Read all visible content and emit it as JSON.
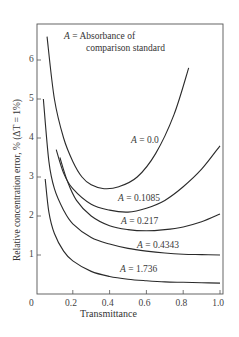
{
  "chart_data": {
    "type": "line",
    "title": "",
    "xlabel": "Transmittance",
    "ylabel": "Relative concentration error, % (ΔT = 1%)",
    "xlim": [
      0,
      1.0
    ],
    "ylim": [
      0,
      6.9
    ],
    "xticks": [
      "0",
      "0.2",
      "0.4",
      "0.6",
      "0.8",
      "1.0"
    ],
    "yticks": [
      "1",
      "2",
      "3",
      "4",
      "5",
      "6"
    ],
    "grid": false,
    "legend": {
      "line1_var": "A",
      "line1_text": " = Absorbance of",
      "line2_text": "comparison standard"
    },
    "series": [
      {
        "name": "A = 0.0",
        "label_var": "A",
        "label_text": " = 0.0",
        "x": [
          0.06,
          0.1,
          0.15,
          0.2,
          0.25,
          0.3,
          0.37,
          0.45,
          0.55,
          0.65,
          0.75,
          0.83
        ],
        "y": [
          6.6,
          5.0,
          4.0,
          3.4,
          3.0,
          2.8,
          2.7,
          2.75,
          3.0,
          3.6,
          4.6,
          5.8
        ]
      },
      {
        "name": "A = 0.1085",
        "label_var": "A",
        "label_text": " = 0.1085",
        "x": [
          0.11,
          0.15,
          0.2,
          0.3,
          0.4,
          0.5,
          0.6,
          0.7,
          0.8,
          0.9,
          1.0
        ],
        "y": [
          3.7,
          3.1,
          2.7,
          2.3,
          2.15,
          2.1,
          2.2,
          2.4,
          2.75,
          3.2,
          3.8
        ]
      },
      {
        "name": "A = 0.217",
        "label_var": "A",
        "label_text": " = 0.217",
        "x": [
          0.13,
          0.17,
          0.22,
          0.3,
          0.4,
          0.5,
          0.6,
          0.7,
          0.8,
          0.9,
          1.0
        ],
        "y": [
          3.5,
          2.9,
          2.4,
          2.0,
          1.75,
          1.65,
          1.62,
          1.65,
          1.72,
          1.85,
          2.05
        ]
      },
      {
        "name": "A = 0.4343",
        "label_var": "A",
        "label_text": " = 0.4343",
        "x": [
          0.04,
          0.07,
          0.1,
          0.15,
          0.2,
          0.3,
          0.4,
          0.5,
          0.6,
          0.7,
          0.8,
          0.9,
          1.0
        ],
        "y": [
          5.0,
          3.4,
          2.7,
          2.15,
          1.8,
          1.45,
          1.28,
          1.17,
          1.1,
          1.05,
          1.02,
          1.01,
          1.0
        ]
      },
      {
        "name": "A = 1.736",
        "label_var": "A",
        "label_text": " = 1.736",
        "x": [
          0.05,
          0.07,
          0.1,
          0.15,
          0.2,
          0.3,
          0.4,
          0.5,
          0.6,
          0.7,
          0.8,
          0.9,
          1.0
        ],
        "y": [
          2.95,
          2.1,
          1.55,
          1.1,
          0.85,
          0.58,
          0.45,
          0.38,
          0.34,
          0.31,
          0.3,
          0.29,
          0.28
        ]
      }
    ],
    "label_positions": [
      {
        "x": 131,
        "y": 136
      },
      {
        "x": 118,
        "y": 194
      },
      {
        "x": 121,
        "y": 217
      },
      {
        "x": 137,
        "y": 241
      },
      {
        "x": 120,
        "y": 265
      }
    ]
  }
}
